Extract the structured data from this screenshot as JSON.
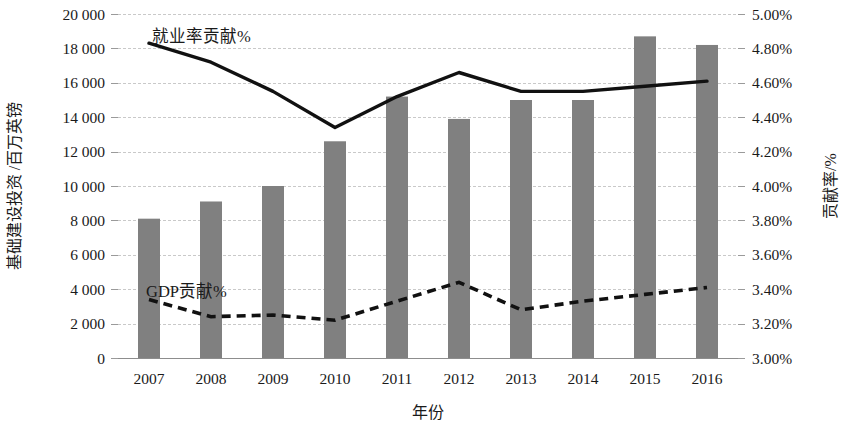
{
  "chart_data": {
    "type": "bar",
    "title": "",
    "subtitle": "",
    "xlabel": "年份",
    "ylabel": "基础建设投资 /百万英镑",
    "y2label": "贡献率/%",
    "categories": [
      "2007",
      "2008",
      "2009",
      "2010",
      "2011",
      "2012",
      "2013",
      "2014",
      "2015",
      "2016"
    ],
    "ylim": [
      0,
      20000
    ],
    "y2lim": [
      3.0,
      5.0
    ],
    "grid": true,
    "legend": "inline-annotations",
    "y_ticks": [
      "0",
      "2 000",
      "4 000",
      "6 000",
      "8 000",
      "10 000",
      "12 000",
      "14 000",
      "16 000",
      "18 000",
      "20 000"
    ],
    "y_tick_values": [
      0,
      2000,
      4000,
      6000,
      8000,
      10000,
      12000,
      14000,
      16000,
      18000,
      20000
    ],
    "y2_ticks": [
      "3.00%",
      "3.20%",
      "3.40%",
      "3.60%",
      "3.80%",
      "4.00%",
      "4.20%",
      "4.40%",
      "4.60%",
      "4.80%",
      "5.00%"
    ],
    "y2_tick_values": [
      3.0,
      3.2,
      3.4,
      3.6,
      3.8,
      4.0,
      4.2,
      4.4,
      4.6,
      4.8,
      5.0
    ],
    "series": [
      {
        "name": "基础建设投资",
        "kind": "bar",
        "axis": "left",
        "color": "#808080",
        "values": [
          8100,
          9100,
          10000,
          12600,
          15200,
          13900,
          15000,
          15000,
          18700,
          18200
        ]
      },
      {
        "name": "就业率贡献%",
        "kind": "line",
        "style": "solid",
        "axis": "right",
        "color": "#111111",
        "values": [
          4.83,
          4.72,
          4.55,
          4.34,
          4.52,
          4.66,
          4.55,
          4.55,
          4.58,
          4.61
        ]
      },
      {
        "name": "GDP贡献%",
        "kind": "line",
        "style": "dashed",
        "axis": "right",
        "color": "#111111",
        "values": [
          3.34,
          3.24,
          3.25,
          3.22,
          3.33,
          3.44,
          3.28,
          3.33,
          3.37,
          3.41
        ]
      }
    ],
    "annotations": [
      {
        "text": "就业率贡献%",
        "x": 152,
        "y": 42
      },
      {
        "text": "GDP贡献%",
        "x": 146,
        "y": 297
      }
    ]
  }
}
